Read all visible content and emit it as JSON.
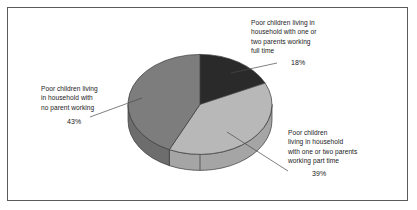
{
  "figure": {
    "background_color": "#ffffff",
    "border_color": "#5b5b5b"
  },
  "chart_data": {
    "type": "pie",
    "title": "",
    "subtitle": "",
    "xlabel": "",
    "ylabel": "",
    "legend_position": "none",
    "grid": false,
    "three_d": true,
    "categories": [
      "Poor children living in household with one or two parents working full time",
      "Poor children living in household with one or two parents working part time",
      "Poor children living in household with no parent working"
    ],
    "values": [
      18,
      39,
      43
    ],
    "value_labels": [
      "18%",
      "39%",
      "43%"
    ],
    "colors": [
      "#2a2a2a",
      "#b8b8b8",
      "#7d7d7d"
    ],
    "slices": [
      {
        "label": "Poor children living in household with one or two parents working full time",
        "value": 18,
        "value_label": "18%",
        "color": "#2a2a2a"
      },
      {
        "label": "Poor children living in household with one or two parents working part time",
        "value": 39,
        "value_label": "39%",
        "color": "#b8b8b8"
      },
      {
        "label": "Poor children living in household with no parent working",
        "value": 43,
        "value_label": "43%",
        "color": "#7d7d7d"
      }
    ]
  },
  "labels": {
    "full_time": {
      "text": "Poor children living in\nhousehold with one or\ntwo parents working\nfull time",
      "percent": "18%"
    },
    "no_parent": {
      "text": "Poor children living\nin household with\nno parent working",
      "percent": "43%"
    },
    "part_time": {
      "text": "Poor children\nliving in household\nwith one or two parents\nworking part time",
      "percent": "39%"
    }
  }
}
